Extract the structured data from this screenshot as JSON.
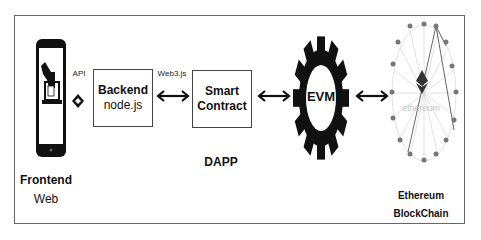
{
  "diagram": {
    "frontend": {
      "title": "Frontend",
      "subtitle": "Web",
      "icon": "smartphone-voting-icon"
    },
    "api_link": {
      "label": "API"
    },
    "backend": {
      "title": "Backend",
      "subtitle": "node.js"
    },
    "web3_link": {
      "label": "Web3.js"
    },
    "smart_contract": {
      "line1": "Smart",
      "line2": "Contract"
    },
    "dapp_label": "DAPP",
    "evm": {
      "label": "EVM",
      "icon": "gear-icon"
    },
    "blockchain": {
      "network_label": "ethereum",
      "title": "Ethereum",
      "subtitle": "BlockChain",
      "icon": "ethereum-network-icon"
    },
    "colors": {
      "ink": "#111111",
      "frame": "#666666",
      "network": "#cfcfcf",
      "node": "#777777"
    }
  }
}
